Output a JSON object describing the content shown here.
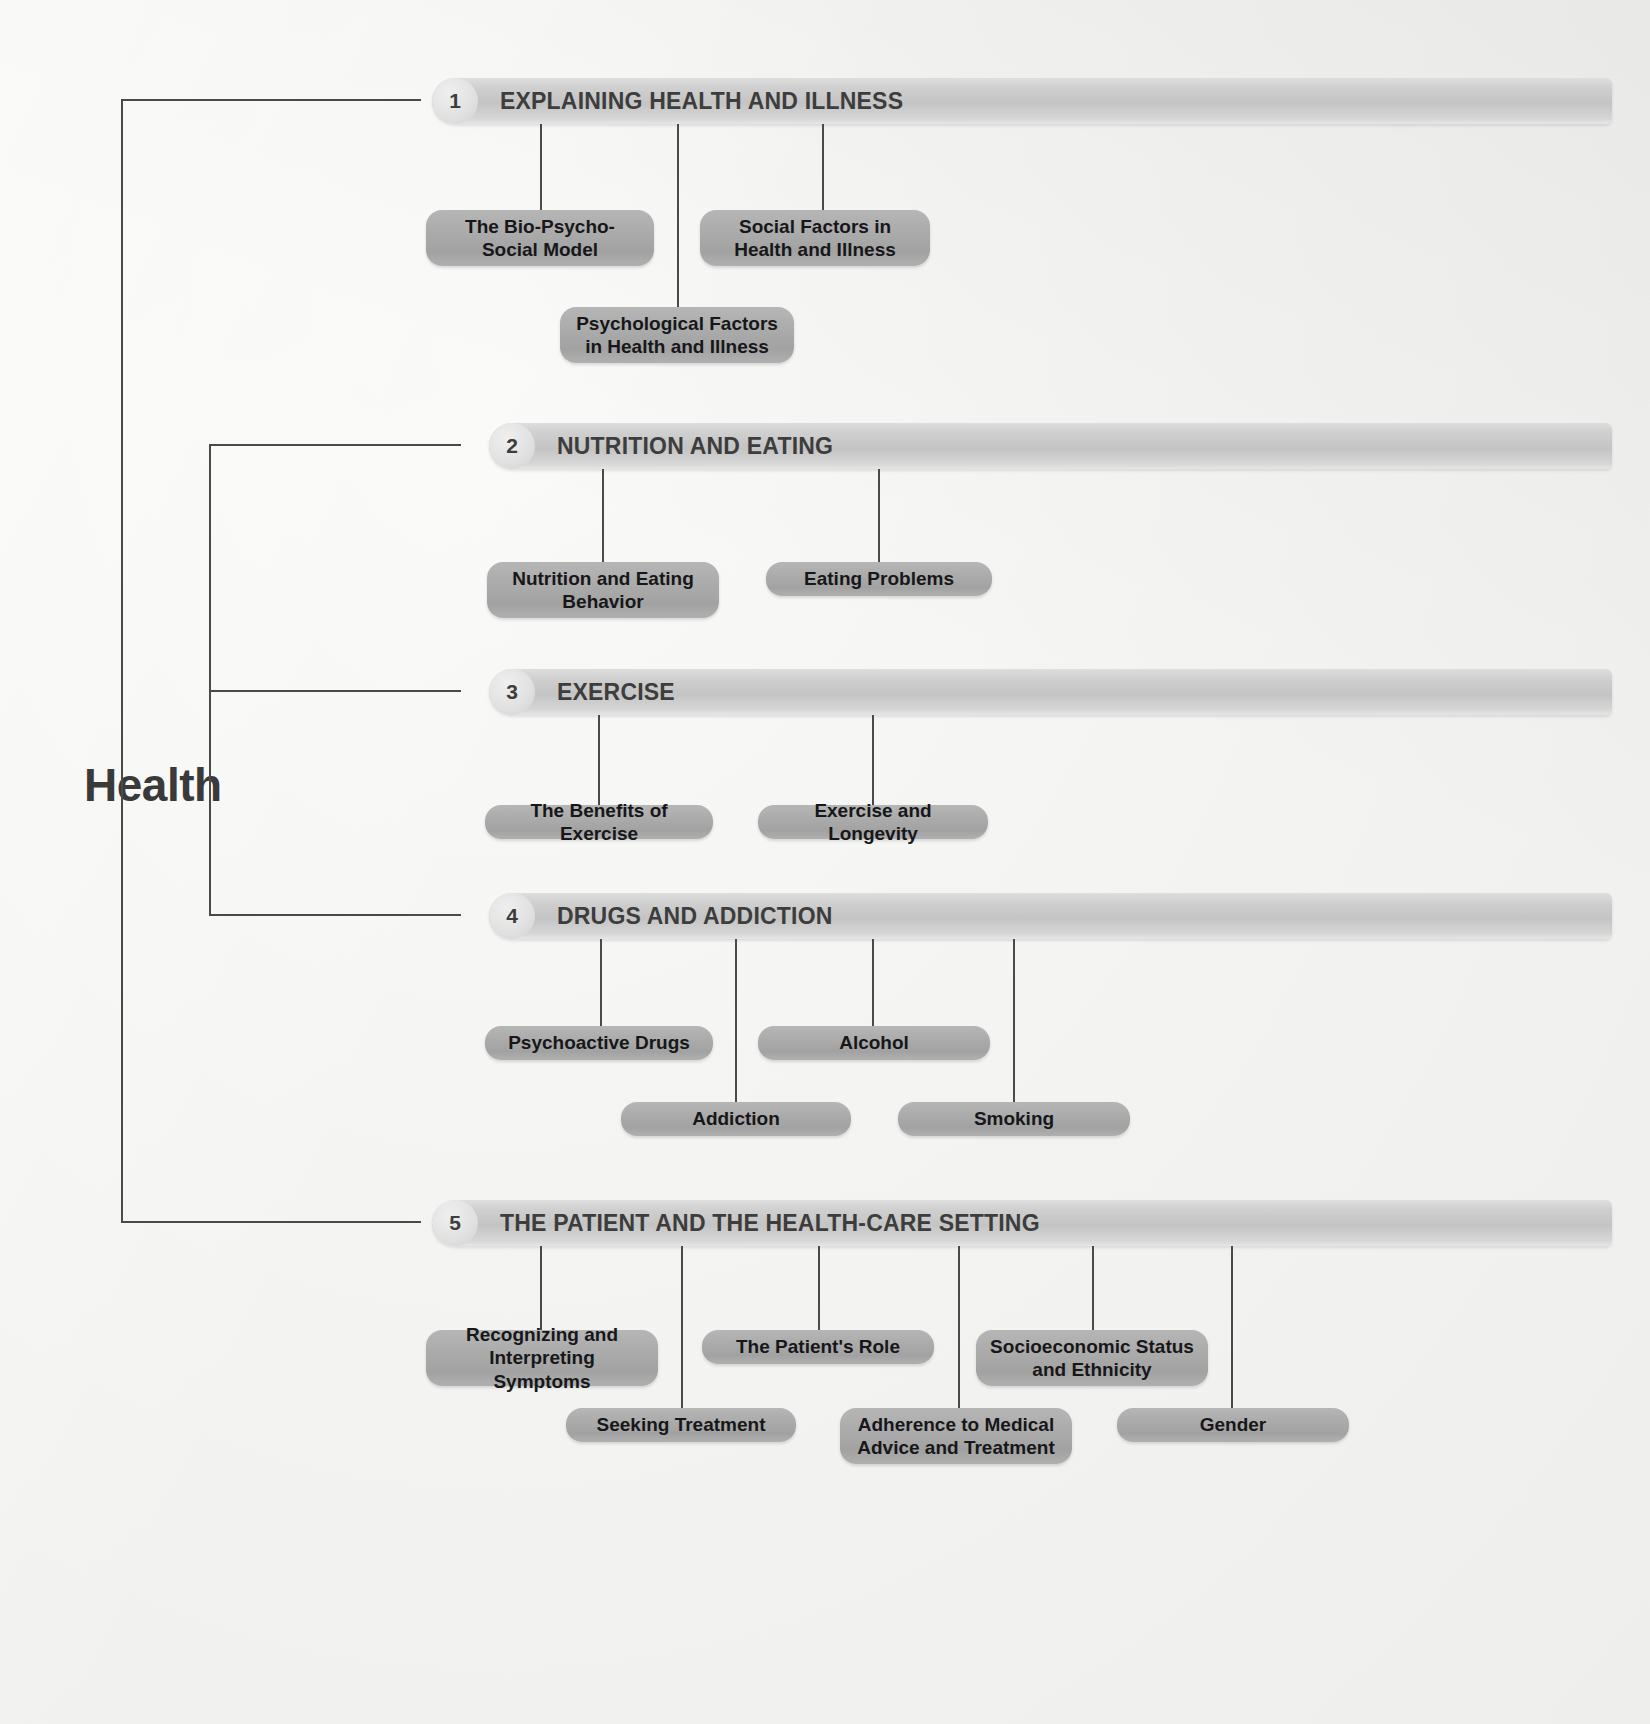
{
  "diagram": {
    "type": "concept-map",
    "root": {
      "label": "Health"
    },
    "sections": [
      {
        "number": "1",
        "title": "EXPLAINING HEALTH AND ILLNESS",
        "topics": [
          "The Bio-Psycho-Social Model",
          "Social Factors in Health and Illness",
          "Psychological Factors in Health and Illness"
        ]
      },
      {
        "number": "2",
        "title": "NUTRITION AND EATING",
        "topics": [
          "Nutrition and Eating Behavior",
          "Eating Problems"
        ]
      },
      {
        "number": "3",
        "title": "EXERCISE",
        "topics": [
          "The Benefits of Exercise",
          "Exercise and Longevity"
        ]
      },
      {
        "number": "4",
        "title": "DRUGS AND ADDICTION",
        "topics": [
          "Psychoactive Drugs",
          "Alcohol",
          "Addiction",
          "Smoking"
        ]
      },
      {
        "number": "5",
        "title": "THE PATIENT AND THE HEALTH-CARE SETTING",
        "topics": [
          "Recognizing and Interpreting Symptoms",
          "The Patient's Role",
          "Socioeconomic Status and Ethnicity",
          "Seeking Treatment",
          "Adherence to Medical Advice and Treatment",
          "Gender"
        ]
      }
    ],
    "colors": {
      "background": "#f2f2f0",
      "section_bar": "#c4c4c4",
      "topic_box": "#a8a8a8",
      "text": "#17171a",
      "header_text": "#3d3d3d",
      "connector": "#4a4a4a"
    }
  }
}
